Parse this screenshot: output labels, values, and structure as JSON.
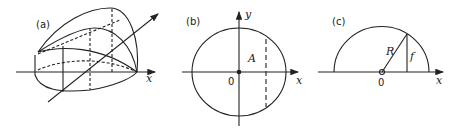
{
  "panels": {
    "a": {
      "label": "(a)",
      "axis_label": "x"
    },
    "b": {
      "label": "(b)",
      "x_label": "x",
      "y_label": "y",
      "region_label": "A",
      "origin_label": "0"
    },
    "c": {
      "label": "(c)",
      "x_label": "x",
      "radius_label": "R",
      "height_label": "f",
      "origin_label": "0"
    }
  },
  "colors": {
    "stroke": "#222222",
    "background": "#ffffff"
  }
}
